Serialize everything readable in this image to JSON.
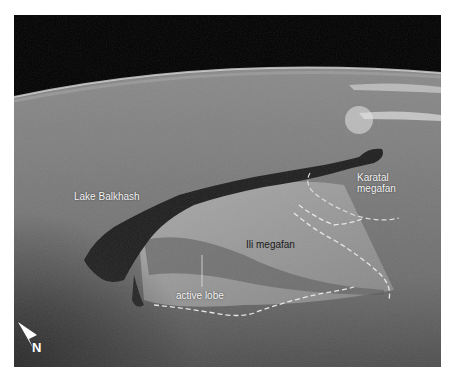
{
  "figure": {
    "labels": {
      "lake": "Lake Balkhash",
      "karatal_line1": "Karatal",
      "karatal_line2": "megafan",
      "ili": "Ili megafan",
      "active_lobe": "active lobe",
      "north": "N"
    },
    "colors": {
      "space": "#000000",
      "terrain": "#7a7a7a",
      "lake": "#1e1e1e",
      "dashed_line": "#e8e8e8",
      "label_white": "#f2f2f2",
      "label_dark": "#1a1a1a"
    }
  }
}
